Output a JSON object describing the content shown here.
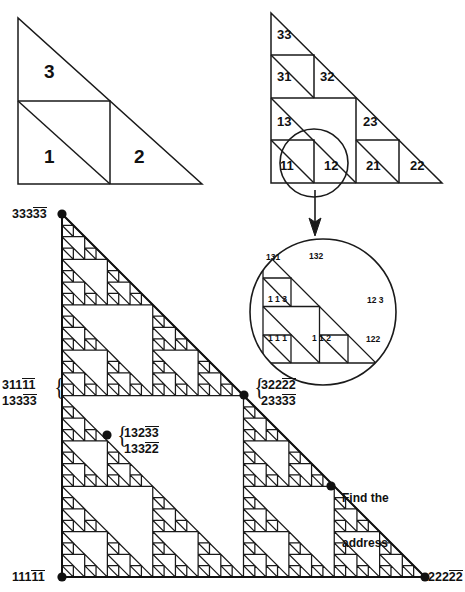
{
  "figures": {
    "level1": {
      "name": "level-1-triangle",
      "labels": [
        {
          "text": "3",
          "x": 36,
          "y": 58
        },
        {
          "text": "1",
          "x": 36,
          "y": 145
        },
        {
          "text": "2",
          "x": 128,
          "y": 145
        }
      ]
    },
    "level2": {
      "name": "level-2-triangle",
      "labels": [
        {
          "text": "33",
          "x": 277,
          "y": 28
        },
        {
          "text": "31",
          "x": 277,
          "y": 70
        },
        {
          "text": "32",
          "x": 320,
          "y": 70
        },
        {
          "text": "13",
          "x": 277,
          "y": 116
        },
        {
          "text": "23",
          "x": 363,
          "y": 116
        },
        {
          "text": "11",
          "x": 280,
          "y": 160
        },
        {
          "text": "12",
          "x": 324,
          "y": 160
        },
        {
          "text": "21",
          "x": 366,
          "y": 160
        },
        {
          "text": "22",
          "x": 410,
          "y": 160
        }
      ]
    },
    "magnifier": {
      "name": "magnified-detail-circle",
      "labels": [
        {
          "text": "131",
          "x": 266,
          "y": 253
        },
        {
          "text": "132",
          "x": 309,
          "y": 252
        },
        {
          "text": "1 1 3",
          "x": 268,
          "y": 295
        },
        {
          "text": "12 3",
          "x": 367,
          "y": 296
        },
        {
          "text": "1 1 1",
          "x": 268,
          "y": 334
        },
        {
          "text": "1 1 2",
          "x": 312,
          "y": 334
        },
        {
          "text": "122",
          "x": 366,
          "y": 335
        }
      ]
    },
    "fractal": {
      "name": "sierpinski-address-fractal",
      "apex": {
        "x": 62,
        "y": 214
      },
      "bottom_left": {
        "x": 62,
        "y": 577
      },
      "bottom_right": {
        "x": 425,
        "y": 577
      },
      "depth": 5
    }
  },
  "addresses": {
    "top_left": {
      "digits": "33333",
      "overline_from": 3
    },
    "left_mid": [
      {
        "digits": "31111",
        "overline_from": 3
      },
      {
        "digits": "13333",
        "overline_from": 3
      }
    ],
    "center_mid": [
      {
        "digits": "32222",
        "overline_from": 3
      },
      {
        "digits": "23333",
        "overline_from": 3
      }
    ],
    "inner": [
      {
        "digits": "13233",
        "overline_from": 3
      },
      {
        "digits": "13322",
        "overline_from": 3
      }
    ],
    "bottom_left": {
      "digits": "11111",
      "overline_from": 3
    },
    "bottom_right": {
      "digits": "22222",
      "overline_from": 3
    }
  },
  "annotation": {
    "find_line1": "Find the",
    "find_line2": "address"
  },
  "markers": [
    {
      "name": "vertex-dot-33333",
      "x": 62,
      "y": 214
    },
    {
      "name": "vertex-dot-32222-23333",
      "x": 244,
      "y": 395
    },
    {
      "name": "vertex-dot-13233-13322",
      "x": 107,
      "y": 435
    },
    {
      "name": "vertex-dot-find-address",
      "x": 331,
      "y": 486
    },
    {
      "name": "vertex-dot-11111",
      "x": 62,
      "y": 577
    },
    {
      "name": "vertex-dot-22222",
      "x": 425,
      "y": 577
    }
  ],
  "colors": {
    "ink": "#111111",
    "paper": "#ffffff"
  }
}
